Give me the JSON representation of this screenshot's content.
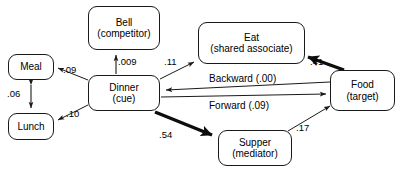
{
  "diagram": {
    "type": "path-model-diagram",
    "nodes": [
      {
        "id": "meal",
        "title": "Meal",
        "subtitle": "",
        "x": 8,
        "y": 54,
        "w": 46,
        "h": 26
      },
      {
        "id": "lunch",
        "title": "Lunch",
        "subtitle": "",
        "x": 8,
        "y": 113,
        "w": 46,
        "h": 27
      },
      {
        "id": "bell",
        "title": "Bell",
        "subtitle": "(competitor)",
        "x": 88,
        "y": 6,
        "w": 72,
        "h": 44
      },
      {
        "id": "dinner",
        "title": "Dinner",
        "subtitle": "(cue)",
        "x": 88,
        "y": 75,
        "w": 72,
        "h": 36
      },
      {
        "id": "eat",
        "title": "Eat",
        "subtitle": "(shared associate)",
        "x": 198,
        "y": 22,
        "w": 107,
        "h": 42
      },
      {
        "id": "food",
        "title": "Food",
        "subtitle": "(target)",
        "x": 330,
        "y": 70,
        "w": 65,
        "h": 41
      },
      {
        "id": "supper",
        "title": "Supper",
        "subtitle": "(mediator)",
        "x": 218,
        "y": 130,
        "w": 74,
        "h": 36
      }
    ],
    "edges": [
      {
        "id": "dinner-meal",
        "from": "dinner",
        "to": "meal",
        "label": ".09",
        "weight": "thin",
        "label_x": 63,
        "label_y": 64
      },
      {
        "id": "meal-lunch",
        "from": "meal",
        "to": "lunch",
        "label": ".06",
        "weight": "thin",
        "label_x": 7,
        "label_y": 88,
        "bidirectional": true
      },
      {
        "id": "dinner-lunch",
        "from": "dinner",
        "to": "lunch",
        "label": ".10",
        "weight": "thin",
        "label_x": 66,
        "label_y": 108
      },
      {
        "id": "dinner-bell",
        "from": "dinner",
        "to": "bell",
        "label": ".009",
        "weight": "thin",
        "label_x": 118,
        "label_y": 56
      },
      {
        "id": "dinner-eat",
        "from": "dinner",
        "to": "eat",
        "label": ".11",
        "weight": "thin",
        "label_x": 164,
        "label_y": 56
      },
      {
        "id": "food-eat",
        "from": "food",
        "to": "eat",
        "label": ".41",
        "weight": "thick",
        "label_x": 310,
        "label_y": 56
      },
      {
        "id": "food-dinner",
        "from": "food",
        "to": "dinner",
        "label": "Backward (.00)",
        "weight": "thin",
        "label_x": 209,
        "label_y": 73
      },
      {
        "id": "dinner-food",
        "from": "dinner",
        "to": "food",
        "label": "Forward (.09)",
        "weight": "thin",
        "label_x": 209,
        "label_y": 100
      },
      {
        "id": "dinner-supper",
        "from": "dinner",
        "to": "supper",
        "label": ".54",
        "weight": "thick",
        "label_x": 159,
        "label_y": 129
      },
      {
        "id": "supper-food",
        "from": "supper",
        "to": "food",
        "label": ".17",
        "weight": "thin",
        "label_x": 296,
        "label_y": 122
      }
    ],
    "colors": {
      "stroke": "#1a1a1a",
      "background": "#ffffff",
      "text": "#000000"
    }
  }
}
